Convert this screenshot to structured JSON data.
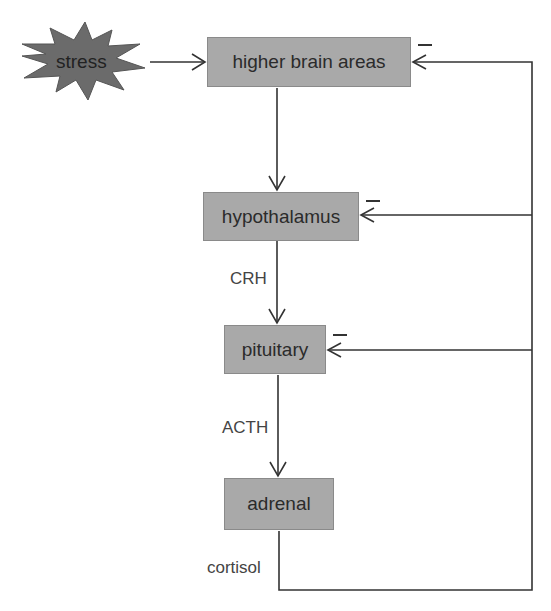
{
  "diagram": {
    "stimulus": {
      "label": "stress",
      "shape": "starburst",
      "color": "#6b6b6b"
    },
    "nodes": [
      {
        "id": "higher",
        "label": "higher brain areas"
      },
      {
        "id": "hypothalamus",
        "label": "hypothalamus"
      },
      {
        "id": "pituitary",
        "label": "pituitary"
      },
      {
        "id": "adrenal",
        "label": "adrenal"
      }
    ],
    "edges": [
      {
        "from": "stress",
        "to": "higher",
        "label": ""
      },
      {
        "from": "higher",
        "to": "hypothalamus",
        "label": ""
      },
      {
        "from": "hypothalamus",
        "to": "pituitary",
        "label": "CRH"
      },
      {
        "from": "pituitary",
        "to": "adrenal",
        "label": "ACTH"
      },
      {
        "from": "adrenal",
        "to": "feedback",
        "label": "cortisol"
      }
    ],
    "feedback": {
      "sign": "−",
      "targets": [
        "higher",
        "hypothalamus",
        "pituitary"
      ]
    },
    "box_color": "#a9a9a9",
    "line_color": "#333333"
  }
}
